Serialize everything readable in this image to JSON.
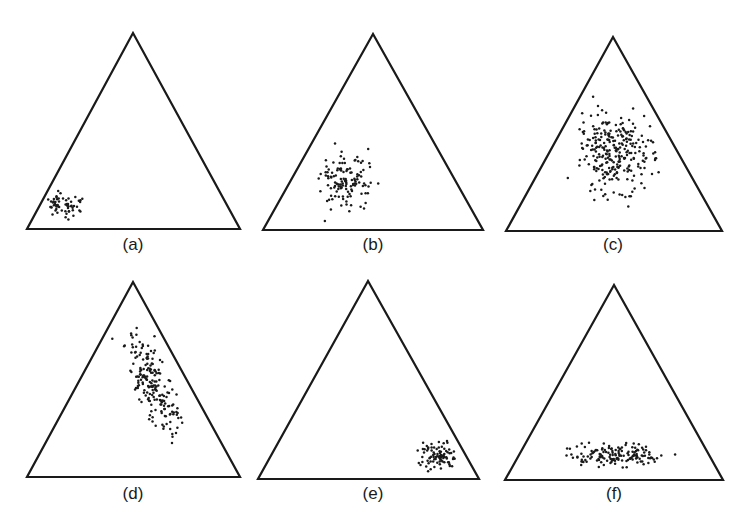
{
  "figure": {
    "panels": [
      {
        "id": "a",
        "label": "(a)",
        "triangle": {
          "apex": [
            133,
            33
          ],
          "left": [
            27,
            229
          ],
          "right": [
            240,
            229
          ]
        },
        "label_pos": [
          133,
          250
        ],
        "cluster": {
          "cx": 62,
          "cy": 205,
          "sx": 16,
          "sy": 13,
          "rot": 0,
          "count": 60,
          "seed": 11,
          "position": "lower-left corner"
        }
      },
      {
        "id": "b",
        "label": "(b)",
        "triangle": {
          "apex": [
            373,
            34
          ],
          "left": [
            263,
            230
          ],
          "right": [
            483,
            230
          ]
        },
        "label_pos": [
          373,
          250
        ],
        "cluster": {
          "cx": 347,
          "cy": 181,
          "sx": 22,
          "sy": 25,
          "rot": 0,
          "count": 125,
          "seed": 23,
          "position": "lower-left-center"
        }
      },
      {
        "id": "c",
        "label": "(c)",
        "triangle": {
          "apex": [
            613,
            37
          ],
          "left": [
            506,
            231
          ],
          "right": [
            722,
            231
          ]
        },
        "label_pos": [
          613,
          250
        ],
        "cluster": {
          "cx": 615,
          "cy": 153,
          "sx": 32,
          "sy": 36,
          "rot": 0,
          "count": 270,
          "seed": 37,
          "position": "center, broad"
        }
      },
      {
        "id": "d",
        "label": "(d)",
        "triangle": {
          "apex": [
            133,
            282
          ],
          "left": [
            27,
            477
          ],
          "right": [
            240,
            477
          ]
        },
        "label_pos": [
          133,
          499
        ],
        "cluster": {
          "cx": 154,
          "cy": 388,
          "sx": 15,
          "sy": 45,
          "rot": -0.42,
          "count": 190,
          "seed": 53,
          "position": "elongated band along right edge"
        }
      },
      {
        "id": "e",
        "label": "(e)",
        "triangle": {
          "apex": [
            368,
            281
          ],
          "left": [
            258,
            479
          ],
          "right": [
            479,
            479
          ]
        },
        "label_pos": [
          373,
          499
        ],
        "cluster": {
          "cx": 437,
          "cy": 456,
          "sx": 14,
          "sy": 12,
          "rot": 0,
          "count": 85,
          "seed": 71,
          "position": "lower-right corner"
        }
      },
      {
        "id": "f",
        "label": "(f)",
        "triangle": {
          "apex": [
            614,
            285
          ],
          "left": [
            505,
            480
          ],
          "right": [
            723,
            480
          ]
        },
        "label_pos": [
          614,
          499
        ],
        "cluster": {
          "cx": 616,
          "cy": 455,
          "sx": 40,
          "sy": 10,
          "rot": 0,
          "count": 150,
          "seed": 89,
          "position": "horizontal band near base"
        }
      }
    ]
  }
}
